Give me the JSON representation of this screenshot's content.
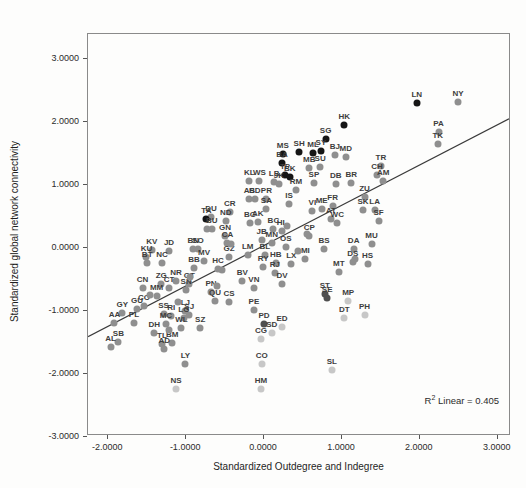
{
  "chart_data": {
    "type": "scatter",
    "title": "",
    "xlabel": "Standardized Outdegree and Indegree",
    "ylabel": "Standardized global network connectivity",
    "xlim": [
      -2.26,
      3.17
    ],
    "ylim": [
      -2.98,
      3.4
    ],
    "grid": false,
    "x_ticks": {
      "values": [
        -2,
        -1,
        0,
        1,
        2,
        3
      ],
      "labels": [
        "-2.0000",
        "-1.0000",
        "0.0000",
        "1.0000",
        "2.0000",
        "3.0000"
      ]
    },
    "y_ticks": {
      "values": [
        3,
        2,
        1,
        0,
        -1,
        -2,
        -3
      ],
      "labels": [
        "3.0000",
        "2.0000",
        "1.0000",
        "0.0000",
        "-1.0000",
        "-2.0000",
        "-3.0000"
      ]
    },
    "annotation": {
      "prefix": "R",
      "sup": "2",
      "rest": " Linear = 0.405"
    },
    "regression_line": {
      "slope": 0.64,
      "intercept": 0.02
    },
    "colors": {
      "b": "#151515",
      "d": "#4f4f4f",
      "m": "#8f8f8f",
      "l": "#c7c7c7",
      "frame": "#8a8a8a",
      "line": "#3a3a3a"
    },
    "points": [
      [
        "NY",
        2.49,
        2.32,
        "m"
      ],
      [
        "LN",
        1.96,
        2.3,
        "b"
      ],
      [
        "HK",
        1.03,
        1.95,
        "b"
      ],
      [
        "PA",
        2.24,
        1.84,
        "m"
      ],
      [
        "TK",
        2.23,
        1.65,
        "m"
      ],
      [
        "SG",
        0.79,
        1.73,
        "b"
      ],
      [
        "SY",
        0.73,
        1.54,
        "b"
      ],
      [
        "ML",
        0.63,
        1.51,
        "b"
      ],
      [
        "SH",
        0.45,
        1.52,
        "b"
      ],
      [
        "MS",
        0.24,
        1.49,
        "b"
      ],
      [
        "BJ",
        0.91,
        1.48,
        "m"
      ],
      [
        "MD",
        1.05,
        1.44,
        "m"
      ],
      [
        "BA",
        0.23,
        1.35,
        "b"
      ],
      [
        "TR",
        1.5,
        1.3,
        "m"
      ],
      [
        "SU",
        0.72,
        1.29,
        "m"
      ],
      [
        "MB",
        0.58,
        1.27,
        "m"
      ],
      [
        "TP",
        0.27,
        1.17,
        "b"
      ],
      [
        "BK",
        0.33,
        1.13,
        "b"
      ],
      [
        "CH",
        1.45,
        1.16,
        "m"
      ],
      [
        "AM",
        1.53,
        1.06,
        "m"
      ],
      [
        "KL",
        -0.19,
        1.06,
        "m"
      ],
      [
        "WS",
        -0.06,
        1.06,
        "m"
      ],
      [
        "LB",
        0.13,
        1.05,
        "m"
      ],
      [
        "JK",
        0.19,
        1.02,
        "m"
      ],
      [
        "SP",
        0.64,
        1.03,
        "m"
      ],
      [
        "DB",
        0.92,
        1.02,
        "m"
      ],
      [
        "BR",
        1.12,
        1.03,
        "m"
      ],
      [
        "RM",
        0.41,
        0.92,
        "m"
      ],
      [
        "ZU",
        1.29,
        0.81,
        "m"
      ],
      [
        "AS",
        -0.19,
        0.78,
        "m"
      ],
      [
        "BD",
        -0.12,
        0.78,
        "m"
      ],
      [
        "PR",
        0.03,
        0.78,
        "m"
      ],
      [
        "IS",
        0.32,
        0.7,
        "m"
      ],
      [
        "FR",
        0.88,
        0.67,
        "m"
      ],
      [
        "ME",
        0.74,
        0.62,
        "m"
      ],
      [
        "VI",
        0.62,
        0.59,
        "m"
      ],
      [
        "SA",
        0.03,
        0.62,
        "m"
      ],
      [
        "SK",
        1.27,
        0.6,
        "m"
      ],
      [
        "LA",
        1.42,
        0.6,
        "m"
      ],
      [
        "CR",
        -0.44,
        0.57,
        "m"
      ],
      [
        "DU",
        -0.68,
        0.49,
        "m"
      ],
      [
        "TA",
        -0.74,
        0.46,
        "b"
      ],
      [
        "ND",
        -0.49,
        0.43,
        "m"
      ],
      [
        "SF",
        1.47,
        0.43,
        "m"
      ],
      [
        "AT",
        0.86,
        0.46,
        "m"
      ],
      [
        "WC",
        0.94,
        0.4,
        "m"
      ],
      [
        "BG",
        -0.18,
        0.4,
        "m"
      ],
      [
        "AK",
        -0.08,
        0.41,
        "m"
      ],
      [
        "BU",
        -0.67,
        0.3,
        "m"
      ],
      [
        "BC",
        0.12,
        0.31,
        "m"
      ],
      [
        "HL",
        0.23,
        0.28,
        "m"
      ],
      [
        "GN",
        -0.5,
        0.19,
        "m"
      ],
      [
        "CP",
        0.58,
        0.19,
        "m"
      ],
      [
        "JB",
        -0.03,
        0.13,
        "m"
      ],
      [
        "MN",
        0.1,
        0.08,
        "m"
      ],
      [
        "CA",
        -0.47,
        0.08,
        "m"
      ],
      [
        "MU",
        1.38,
        0.06,
        "m"
      ],
      [
        "BS",
        0.77,
        -0.02,
        "m"
      ],
      [
        "DA",
        1.15,
        -0.02,
        "m"
      ],
      [
        "KV",
        -1.44,
        -0.03,
        "m"
      ],
      [
        "JD",
        -1.22,
        -0.05,
        "m"
      ],
      [
        "BN",
        -0.91,
        -0.02,
        "m"
      ],
      [
        "SO",
        -0.85,
        -0.02,
        "m"
      ],
      [
        "LM",
        -0.21,
        -0.1,
        "m"
      ],
      [
        "BL",
        0.01,
        -0.11,
        "m"
      ],
      [
        "OS",
        0.28,
        0.02,
        "m"
      ],
      [
        "KU",
        -1.51,
        -0.14,
        "m"
      ],
      [
        "GZ",
        -0.45,
        -0.14,
        "m"
      ],
      [
        "MV",
        -0.77,
        -0.21,
        "m"
      ],
      [
        "MI",
        0.53,
        -0.17,
        "m"
      ],
      [
        "DS",
        1.14,
        -0.22,
        "m"
      ],
      [
        "HS",
        1.33,
        -0.25,
        "m"
      ],
      [
        "BT",
        -1.5,
        -0.24,
        "m"
      ],
      [
        "NC",
        -1.31,
        -0.24,
        "m"
      ],
      [
        "HB",
        0.15,
        -0.24,
        "m"
      ],
      [
        "LX",
        0.35,
        -0.25,
        "m"
      ],
      [
        "RY",
        -0.01,
        -0.29,
        "m"
      ],
      [
        "BB",
        -0.9,
        -0.32,
        "m"
      ],
      [
        "HC",
        -0.59,
        -0.33,
        "m"
      ],
      [
        "MT",
        0.96,
        -0.38,
        "m"
      ],
      [
        "RJ",
        0.14,
        -0.4,
        "m"
      ],
      [
        "NR",
        -1.13,
        -0.52,
        "m"
      ],
      [
        "BV",
        -0.28,
        -0.52,
        "m"
      ],
      [
        "DV",
        0.23,
        -0.56,
        "m"
      ],
      [
        "GT",
        -0.96,
        -0.57,
        "m"
      ],
      [
        "ZG",
        -1.32,
        -0.57,
        "m"
      ],
      [
        "CN",
        -1.56,
        -0.63,
        "m"
      ],
      [
        "CT",
        -1.22,
        -0.63,
        "m"
      ],
      [
        "VN",
        -0.13,
        -0.63,
        "m"
      ],
      [
        "SN",
        -1.0,
        -0.67,
        "m"
      ],
      [
        "PN",
        -0.68,
        -0.7,
        "m"
      ],
      [
        "ST",
        0.78,
        -0.73,
        "d"
      ],
      [
        "SE",
        0.81,
        -0.79,
        "d"
      ],
      [
        "MM",
        -1.38,
        -0.76,
        "m"
      ],
      [
        "QU",
        -0.63,
        -0.84,
        "m"
      ],
      [
        "CS",
        -0.45,
        -0.86,
        "m"
      ],
      [
        "MP",
        1.08,
        -0.83,
        "l"
      ],
      [
        "GU",
        -1.63,
        -0.97,
        "m"
      ],
      [
        "CO",
        -1.54,
        -0.92,
        "m"
      ],
      [
        "PE",
        -0.13,
        -0.98,
        "m"
      ],
      [
        "GY",
        -1.82,
        -1.02,
        "m"
      ],
      [
        "LJ",
        -1.01,
        -1.0,
        "m"
      ],
      [
        "SS",
        -1.29,
        -1.05,
        "m"
      ],
      [
        "SJ",
        -0.96,
        -1.06,
        "m"
      ],
      [
        "RI",
        -1.19,
        -1.08,
        "m"
      ],
      [
        "LG",
        -1.03,
        -1.11,
        "m"
      ],
      [
        "DT",
        1.03,
        -1.11,
        "l"
      ],
      [
        "PH",
        1.29,
        -1.06,
        "l"
      ],
      [
        "AA",
        -1.92,
        -1.19,
        "m"
      ],
      [
        "PL",
        -1.67,
        -1.19,
        "m"
      ],
      [
        "PD",
        0.0,
        -1.21,
        "d"
      ],
      [
        "MC",
        -1.26,
        -1.21,
        "m"
      ],
      [
        "ED",
        0.23,
        -1.25,
        "l"
      ],
      [
        "SZ",
        -0.82,
        -1.27,
        "m"
      ],
      [
        "WL",
        -1.06,
        -1.27,
        "m"
      ],
      [
        "SD",
        0.1,
        -1.35,
        "l"
      ],
      [
        "DH",
        -1.41,
        -1.35,
        "m"
      ],
      [
        "CG",
        -0.04,
        -1.44,
        "l"
      ],
      [
        "SB",
        -1.87,
        -1.49,
        "m"
      ],
      [
        "BM",
        -1.18,
        -1.51,
        "m"
      ],
      [
        "TL",
        -1.31,
        -1.52,
        "m"
      ],
      [
        "AD",
        -1.28,
        -1.6,
        "m"
      ],
      [
        "AL",
        -1.97,
        -1.57,
        "m"
      ],
      [
        "LY",
        -1.01,
        -1.84,
        "m"
      ],
      [
        "CO",
        -0.03,
        -1.84,
        "l"
      ],
      [
        "HM",
        -0.04,
        -2.24,
        "l"
      ],
      [
        "NS",
        -1.13,
        -2.24,
        "l"
      ],
      [
        "SL",
        0.87,
        -1.94,
        "l"
      ],
      [
        "",
        -0.73,
        0.3,
        "m"
      ],
      [
        "",
        -0.42,
        0.06,
        "m"
      ],
      [
        "",
        -0.54,
        -0.35,
        "m"
      ],
      [
        "",
        1.17,
        -0.17,
        "m"
      ],
      [
        "",
        -1.22,
        -1.29,
        "m"
      ],
      [
        "",
        0.55,
        0.23,
        "m"
      ],
      [
        "",
        -1.47,
        -0.75,
        "m"
      ],
      [
        "",
        -0.95,
        -0.45,
        "m"
      ],
      [
        "",
        0.44,
        -0.05,
        "m"
      ],
      [
        "",
        -0.6,
        -0.6,
        "m"
      ],
      [
        "",
        0.3,
        0.36,
        "m"
      ],
      [
        "",
        -1.1,
        -0.85,
        "m"
      ]
    ]
  }
}
